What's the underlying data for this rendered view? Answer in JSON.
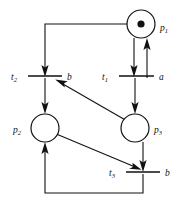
{
  "diagram": {
    "kind": "petri-net",
    "background_color": "#ffffff",
    "line_color": "#111111",
    "width": 182,
    "height": 204,
    "places": [
      {
        "id": "p1",
        "label": "p",
        "subscript": "1",
        "cx": 141,
        "cy": 24,
        "r": 14,
        "tokens": 1,
        "token_r": 3.6,
        "label_x": 160,
        "label_y": 31
      },
      {
        "id": "p2",
        "label": "p",
        "subscript": "2",
        "cx": 45,
        "cy": 128,
        "r": 14,
        "tokens": 0,
        "token_r": 0,
        "label_x": 13,
        "label_y": 133
      },
      {
        "id": "p3",
        "label": "p",
        "subscript": "3",
        "cx": 135,
        "cy": 128,
        "r": 14,
        "tokens": 0,
        "token_r": 0,
        "label_x": 154,
        "label_y": 133
      }
    ],
    "transitions": [
      {
        "id": "t1",
        "label": "t",
        "subscript": "1",
        "event_label": "a",
        "x1": 119,
        "x2": 154,
        "y": 76,
        "name_x": 104,
        "name_y": 80,
        "event_x": 160,
        "event_y": 80
      },
      {
        "id": "t2",
        "label": "t",
        "subscript": "2",
        "event_label": "b",
        "x1": 28,
        "x2": 62,
        "y": 76,
        "name_x": 13,
        "name_y": 80,
        "event_x": 68,
        "event_y": 80
      },
      {
        "id": "t3",
        "label": "t",
        "subscript": "3",
        "event_label": "b",
        "x1": 126,
        "x2": 160,
        "y": 172,
        "name_x": 111,
        "name_y": 176,
        "event_x": 166,
        "event_y": 176
      }
    ],
    "arcs": [
      {
        "id": "arc-p1-to-t2",
        "from": "p1",
        "to": "t2",
        "shape": "orthogonal",
        "points": "127,24 45,24 45,74"
      },
      {
        "id": "arc-p1-to-t1",
        "from": "p1",
        "to": "t1",
        "shape": "vertical",
        "points": "134,38 134,74"
      },
      {
        "id": "arc-t1-to-p1",
        "from": "t1",
        "to": "p1",
        "shape": "vertical",
        "points": "147,76 147,40"
      },
      {
        "id": "arc-t1-to-p3",
        "from": "t1",
        "to": "p3",
        "shape": "vertical",
        "points": "135,78 135,112"
      },
      {
        "id": "arc-t2-to-p2",
        "from": "t2",
        "to": "p2",
        "shape": "vertical",
        "points": "45,78 45,112"
      },
      {
        "id": "arc-p3-to-t2",
        "from": "p3",
        "to": "t2",
        "shape": "diagonal",
        "points": "124,119 56,80"
      },
      {
        "id": "arc-p2-to-t3",
        "from": "p2",
        "to": "t3",
        "shape": "diagonal",
        "points": "57,135 140,170"
      },
      {
        "id": "arc-p3-to-t3",
        "from": "p3",
        "to": "t3",
        "shape": "vertical",
        "points": "143,142 143,170"
      },
      {
        "id": "arc-t3-to-p2",
        "from": "t3",
        "to": "p2",
        "shape": "orthogonal",
        "points": "143,174 143,193 45,193 45,144"
      }
    ]
  }
}
